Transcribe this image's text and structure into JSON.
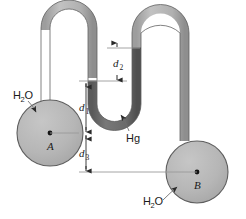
{
  "figure": {
    "labels": {
      "water_left": "H",
      "water_left_sub": "2",
      "water_left_tail": "O",
      "water_right": "H",
      "water_right_sub": "2",
      "water_right_tail": "O",
      "mercury": "Hg",
      "point_a": "A",
      "point_b": "B",
      "d1": "d",
      "d1_sub": "1",
      "d2": "d",
      "d2_sub": "2",
      "d3": "d",
      "d3_sub": "3"
    },
    "colors": {
      "water_fill": "#b5b5b5",
      "mercury_fill": "#6d6d6d",
      "outline": "#4a4a4a",
      "leader_line": "#8d8d8d",
      "dim_line": "#9a9a9a",
      "text": "#1a1a1a",
      "background": "#ffffff"
    },
    "geometry": {
      "bulb_a": {
        "cx": 50,
        "cy": 133,
        "r": 33
      },
      "bulb_b": {
        "cx": 197,
        "cy": 172,
        "r": 31
      },
      "tube_width": 9,
      "d1_top_y": 81,
      "d1_bottom_y": 133,
      "d3_bottom_y": 172,
      "d2_top_y": 48,
      "d2_bottom_y": 81
    }
  }
}
